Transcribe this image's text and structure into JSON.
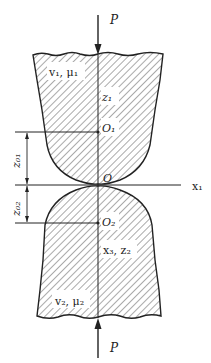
{
  "diagram": {
    "type": "contact-mechanics",
    "colors": {
      "stroke": "#222222",
      "hatch": "#555555",
      "background": "#ffffff"
    },
    "labels": {
      "force_top": "P",
      "force_bottom": "P",
      "body1_props": "v₁, μ₁",
      "body2_props": "v₂, μ₂",
      "z1_axis": "z₁",
      "center1": "O₁",
      "center2": "O₂",
      "origin": "O",
      "x1_axis": "x₁",
      "body2_axes": "x₃, z₂",
      "dim_z01": "z₀₁",
      "dim_z02": "z₀₂"
    }
  }
}
